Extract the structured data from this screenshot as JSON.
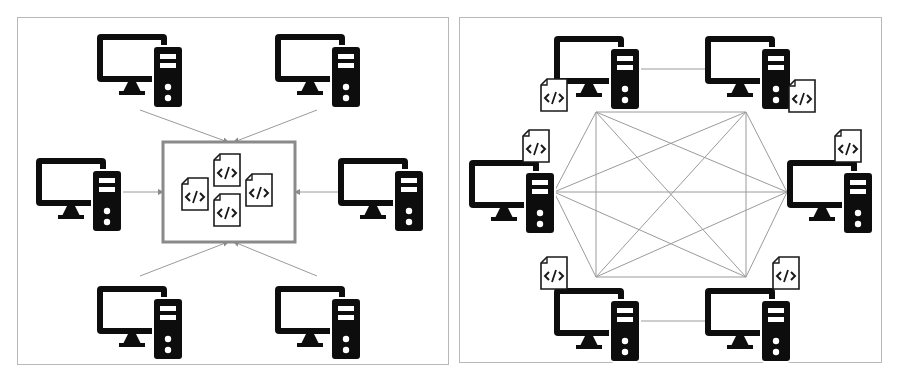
{
  "diagram": {
    "type": "network-topology-comparison",
    "panels": [
      {
        "id": "left",
        "topology": "centralized",
        "description": "Six computers connected by arrows to a central code repository box",
        "center_box": {
          "x": 163,
          "y": 142,
          "w": 132,
          "h": 100,
          "file_count": 4
        },
        "computers": [
          {
            "id": "c1",
            "x": 97,
            "y": 32
          },
          {
            "id": "c2",
            "x": 275,
            "y": 32
          },
          {
            "id": "c3",
            "x": 36,
            "y": 156
          },
          {
            "id": "c4",
            "x": 338,
            "y": 156
          },
          {
            "id": "c5",
            "x": 97,
            "y": 284
          },
          {
            "id": "c6",
            "x": 275,
            "y": 284
          }
        ],
        "edges": [
          {
            "x1": 140,
            "y1": 110,
            "x2": 228,
            "y2": 142
          },
          {
            "x1": 317,
            "y1": 110,
            "x2": 234,
            "y2": 142
          },
          {
            "x1": 120,
            "y1": 192,
            "x2": 163,
            "y2": 192
          },
          {
            "x1": 338,
            "y1": 192,
            "x2": 295,
            "y2": 192
          },
          {
            "x1": 140,
            "y1": 276,
            "x2": 228,
            "y2": 242
          },
          {
            "x1": 317,
            "y1": 276,
            "x2": 234,
            "y2": 242
          }
        ]
      },
      {
        "id": "right",
        "topology": "distributed",
        "description": "Six computers each with a code file, fully meshed peer-to-peer",
        "computers": [
          {
            "id": "p1",
            "x": 554,
            "y": 34,
            "file": {
              "x": 541,
              "y": 79
            }
          },
          {
            "id": "p2",
            "x": 705,
            "y": 34,
            "file": {
              "x": 789,
              "y": 80
            }
          },
          {
            "id": "p3",
            "x": 469,
            "y": 158,
            "file": {
              "x": 523,
              "y": 130
            }
          },
          {
            "id": "p4",
            "x": 787,
            "y": 158,
            "file": {
              "x": 835,
              "y": 130
            }
          },
          {
            "id": "p5",
            "x": 554,
            "y": 286,
            "file": {
              "x": 541,
              "y": 257
            }
          },
          {
            "id": "p6",
            "x": 705,
            "y": 286,
            "file": {
              "x": 773,
              "y": 257
            }
          }
        ],
        "mesh_nodes": [
          {
            "x": 596,
            "y": 112
          },
          {
            "x": 746,
            "y": 112
          },
          {
            "x": 554,
            "y": 192
          },
          {
            "x": 787,
            "y": 192
          },
          {
            "x": 596,
            "y": 277
          },
          {
            "x": 746,
            "y": 277
          }
        ],
        "extra_edges": [
          {
            "x1": 638,
            "y1": 69,
            "x2": 705,
            "y2": 69
          },
          {
            "x1": 638,
            "y1": 321,
            "x2": 705,
            "y2": 321
          }
        ]
      }
    ],
    "colors": {
      "icon": "#0d0d0d",
      "edge": "#9a9a9a",
      "panel_border": "#b8b8b8",
      "center_box_border": "#8a8a8a"
    },
    "file_glyph": "</>"
  }
}
